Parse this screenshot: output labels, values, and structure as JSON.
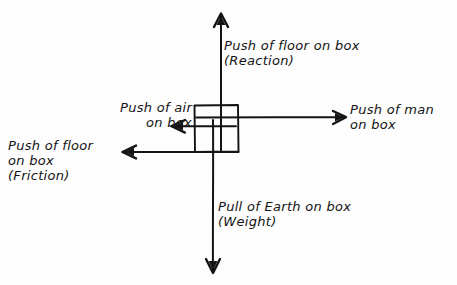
{
  "diagram": {
    "ink_color": "#141414",
    "paper_color": "#fdfdfd",
    "body": {
      "name": "box",
      "shape": "rectangle",
      "x": 194,
      "y": 105,
      "width": 44,
      "height": 47
    },
    "forces": [
      {
        "id": "reaction",
        "direction": "up",
        "label_line1": "Push of floor on box",
        "label_line2": "(Reaction)",
        "arrow": {
          "x1": 221,
          "y1": 150,
          "x2": 221,
          "y2": 14
        }
      },
      {
        "id": "applied",
        "direction": "right",
        "label_line1": "Push of man",
        "label_line2": "on box",
        "arrow": {
          "x1": 196,
          "y1": 117,
          "x2": 346,
          "y2": 117
        }
      },
      {
        "id": "air-resistance",
        "direction": "left",
        "label_line1": "Push of air",
        "label_line2": "on box",
        "arrow": {
          "x1": 236,
          "y1": 126,
          "x2": 171,
          "y2": 126
        }
      },
      {
        "id": "friction",
        "direction": "left",
        "label_line1": "Push of floor",
        "label_line2": "on box",
        "label_line3": "(Friction)",
        "arrow": {
          "x1": 238,
          "y1": 152,
          "x2": 122,
          "y2": 152
        }
      },
      {
        "id": "weight",
        "direction": "down",
        "label_line1": "Pull of Earth on box",
        "label_line2": "(Weight)",
        "arrow": {
          "x1": 213,
          "y1": 120,
          "x2": 213,
          "y2": 273
        }
      }
    ]
  }
}
